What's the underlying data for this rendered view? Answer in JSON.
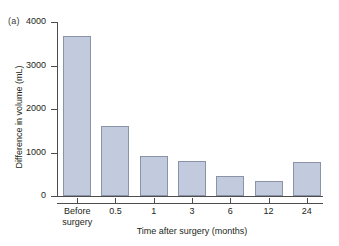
{
  "figure": {
    "panel_label": "(a)"
  },
  "chart_data": {
    "type": "bar",
    "title": "",
    "subtitle": "",
    "categories": [
      "Before surgery",
      "0.5",
      "1",
      "3",
      "6",
      "12",
      "24"
    ],
    "category_lines": [
      [
        "Before",
        "surgery"
      ],
      [
        "0.5"
      ],
      [
        "1"
      ],
      [
        "3"
      ],
      [
        "6"
      ],
      [
        "12"
      ],
      [
        "24"
      ]
    ],
    "values": [
      3680,
      1620,
      930,
      810,
      450,
      350,
      780
    ],
    "xlabel": "Time after surgery (months)",
    "ylabel": "Difference in volume (mL)",
    "ylim": [
      0,
      4000
    ],
    "yticks": [
      0,
      1000,
      2000,
      3000,
      4000
    ],
    "ytick_labels": [
      "0",
      "1000",
      "2000",
      "3000",
      "4000"
    ],
    "grid": false,
    "legend": null,
    "bar_fill_color": "#c2cadd",
    "bar_edge_color": "#8a93a8",
    "axis_color": "#4c4c4c",
    "background_color": "#ffffff"
  }
}
